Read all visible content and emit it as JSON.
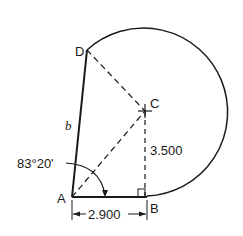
{
  "diagram": {
    "points": {
      "A": {
        "label": "A"
      },
      "B": {
        "label": "B"
      },
      "C": {
        "label": "C"
      },
      "D": {
        "label": "D"
      }
    },
    "side_label": "b",
    "angle_label": "83°20'",
    "height_label": "3.500",
    "base_label": "2.900",
    "colors": {
      "stroke": "#1a1a1a",
      "background": "#ffffff"
    }
  }
}
